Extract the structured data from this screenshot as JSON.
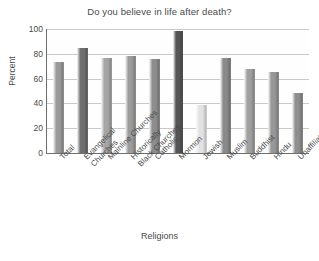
{
  "chart_data": {
    "type": "bar",
    "title": "Do you believe in life after death?",
    "xlabel": "Religions",
    "ylabel": "Percent",
    "ylim": [
      0,
      100
    ],
    "yticks": [
      0,
      20,
      40,
      60,
      80,
      100
    ],
    "grid": true,
    "legend": false,
    "categories": [
      "Total",
      "Evangelical Churches",
      "Mainline Churches",
      "Historically Black Churches",
      "Catholic",
      "Mormon",
      "Jewish",
      "Muslim",
      "Buddhist",
      "Hindu",
      "Unaffiliated"
    ],
    "category_lines": [
      [
        "Total"
      ],
      [
        "Evangelical",
        "Churches"
      ],
      [
        "Mainline Churches"
      ],
      [
        "Historically",
        "Black Churches"
      ],
      [
        "Catholic"
      ],
      [
        "Mormon"
      ],
      [
        "Jewish"
      ],
      [
        "Muslim"
      ],
      [
        "Buddhist"
      ],
      [
        "Hindu"
      ],
      [
        "Unaffiliated"
      ]
    ],
    "values": [
      73,
      85,
      77,
      78,
      76,
      98,
      39,
      77,
      68,
      65,
      48
    ],
    "bar_colors": [
      "#9a9a9a",
      "#6f6f6f",
      "#a6a6a6",
      "#9c9c9c",
      "#8d8d8d",
      "#555555",
      "#e2e2e2",
      "#8a8a8a",
      "#a0a0a0",
      "#979797",
      "#8f8f8f"
    ]
  },
  "colors": {
    "background": "#ffffff",
    "axis": "#6e6e6e",
    "grid": "#c9c9c9",
    "text": "#4a4a4a"
  }
}
